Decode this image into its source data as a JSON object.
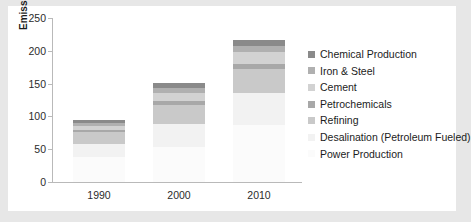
{
  "chart_data": {
    "type": "bar",
    "stacked": true,
    "title": "",
    "xlabel": "",
    "ylabel": "Emissions (Mt CO2-eq/year)",
    "ylabel_parts": {
      "pre": "Emissions (Mt CO",
      "sub": "2",
      "post": "-eq/year)"
    },
    "categories": [
      "1990",
      "2000",
      "2010"
    ],
    "ylim": [
      0,
      250
    ],
    "yticks": [
      0,
      50,
      100,
      150,
      200,
      250
    ],
    "ytick_labels": [
      "0",
      "50",
      "100",
      "150",
      "200",
      "250"
    ],
    "grid": false,
    "legend_position": "right",
    "series": [
      {
        "name": "Chemical Production",
        "color": "#8a8a8a",
        "values": [
          5,
          7,
          9
        ]
      },
      {
        "name": "Iron & Steel",
        "color": "#b0b0b0",
        "values": [
          5,
          8,
          10
        ]
      },
      {
        "name": "Cement",
        "color": "#d2d2d2",
        "values": [
          5,
          12,
          18
        ]
      },
      {
        "name": "Petrochemicals",
        "color": "#a8a8a8",
        "values": [
          4,
          6,
          7
        ]
      },
      {
        "name": "Refining",
        "color": "#c9c9c9",
        "values": [
          18,
          30,
          38
        ]
      },
      {
        "name": "Desalination (Petroleum Fueled)",
        "color": "#f2f2f2",
        "values": [
          20,
          34,
          48
        ]
      },
      {
        "name": "Power Production",
        "color": "#fbfbfb",
        "values": [
          38,
          54,
          87
        ]
      }
    ],
    "totals": [
      95,
      151,
      217
    ]
  },
  "legend": {
    "items": [
      {
        "label": "Chemical Production",
        "color": "#8a8a8a"
      },
      {
        "label": "Iron & Steel",
        "color": "#b0b0b0"
      },
      {
        "label": "Cement",
        "color": "#d2d2d2"
      },
      {
        "label": "Petrochemicals",
        "color": "#a8a8a8"
      },
      {
        "label": "Refining",
        "color": "#c9c9c9"
      },
      {
        "label": "Desalination (Petroleum Fueled)",
        "color": "#f2f2f2"
      },
      {
        "label": "Power Production",
        "color": "#fbfbfb"
      }
    ]
  },
  "axis": {
    "y_title": "Emissions (Mt CO2-eq/year)"
  }
}
